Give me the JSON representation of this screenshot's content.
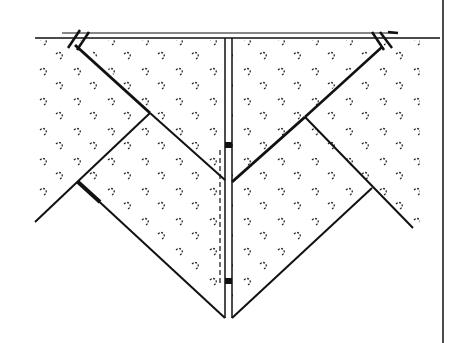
{
  "diagram": {
    "type": "line-drawing",
    "colors": {
      "ink": "#111111",
      "background": "#ffffff"
    },
    "features": [
      "top-horizontal-edge",
      "center-vertical-double-seam",
      "left-diagonal-fold",
      "right-diagonal-fold",
      "bottom-v-point",
      "hatch-marks-left",
      "hatch-marks-right",
      "right-border-line"
    ]
  }
}
